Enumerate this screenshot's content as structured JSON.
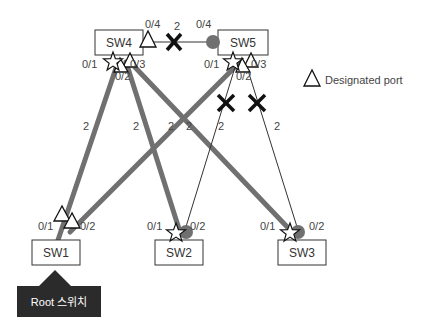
{
  "switches": {
    "sw1": {
      "label": "SW1"
    },
    "sw2": {
      "label": "SW2"
    },
    "sw3": {
      "label": "SW3"
    },
    "sw4": {
      "label": "SW4"
    },
    "sw5": {
      "label": "SW5"
    }
  },
  "ports": {
    "sw4_p1": "0/1",
    "sw4_p2": "0/2",
    "sw4_p3": "0/3",
    "sw4_p4": "0/4",
    "sw5_p1": "0/1",
    "sw5_p2": "0/2",
    "sw5_p3": "0/3",
    "sw5_p4": "0/4",
    "sw1_p1": "0/1",
    "sw1_p2": "0/2",
    "sw2_p1": "0/1",
    "sw2_p2": "0/2",
    "sw3_p1": "0/1",
    "sw3_p2": "0/2"
  },
  "link_costs": {
    "sw4_sw5": "2",
    "sw1_sw4": "2",
    "sw2_sw4": "2",
    "sw3_sw4": "2",
    "sw1_sw5": "2",
    "sw2_sw5": "2",
    "sw3_sw5": "2"
  },
  "legend": {
    "designated_port": "Designated port"
  },
  "root_label": "Root 스위치",
  "colors": {
    "active_link": "#707070",
    "blocked_link": "#333333",
    "blocked_port": "#707070",
    "root_box": "#2b2b2b"
  }
}
